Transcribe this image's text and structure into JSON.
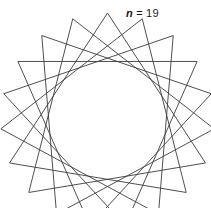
{
  "figure": {
    "label": {
      "variable": "n",
      "equals": " = ",
      "value": "19",
      "full_text": "n = 19"
    },
    "caption_position": "top-right",
    "background_color": "#ffffff",
    "stroke_color": "#3c3c3c",
    "stroke_width": 0.9
  },
  "chart_data": {
    "type": "line",
    "title": "n = 19",
    "subtitle": "",
    "xlabel": "",
    "ylabel": "",
    "n_points": 19,
    "step": 6,
    "closed": true,
    "grid": false,
    "legend": null,
    "axes_visible": false,
    "geometry": {
      "center_x": 107.5,
      "center_y": 120.0,
      "radius": 107.0,
      "start_angle_deg": -90.0,
      "direction": 1
    },
    "envelope_shape": "triangle",
    "vertex_count": 19,
    "chord_count": 19,
    "xlim": [
      0,
      211
    ],
    "ylim": [
      0,
      208
    ],
    "series": [
      {
        "name": "star-polygon-19-6",
        "n": 19,
        "step": 6
      }
    ]
  }
}
